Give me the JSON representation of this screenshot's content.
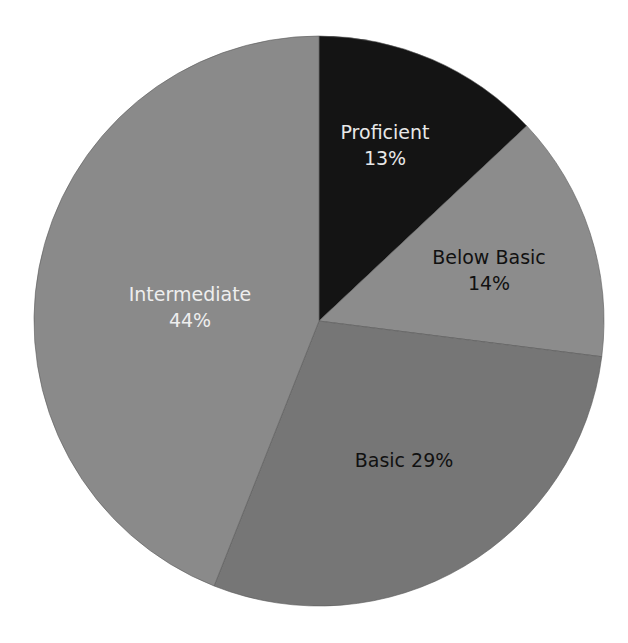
{
  "chart_data": {
    "type": "pie",
    "title": "",
    "start_angle_deg": 0,
    "direction": "clockwise",
    "categories": [
      "Proficient",
      "Below Basic",
      "Basic",
      "Intermediate"
    ],
    "values": [
      13,
      14,
      29,
      44
    ],
    "unit": "%",
    "legend": "none (labels inside slices)",
    "slices": [
      {
        "label": "Proficient",
        "value": 13,
        "value_text": "13%",
        "color": "#141414",
        "text_color": "#e8e8e8",
        "label_layout": "two-line",
        "label_pos": [
          385,
          145
        ]
      },
      {
        "label": "Below Basic",
        "value": 14,
        "value_text": "14%",
        "color": "#8c8c8c",
        "text_color": "#111111",
        "label_layout": "two-line",
        "label_pos": [
          489,
          270
        ]
      },
      {
        "label": "Basic",
        "value": 29,
        "value_text": "29%",
        "color": "#767676",
        "text_color": "#111111",
        "label_layout": "one-line",
        "label_pos": [
          404,
          460
        ]
      },
      {
        "label": "Intermediate",
        "value": 44,
        "value_text": "44%",
        "color": "#8a8a8a",
        "text_color": "#eeeeee",
        "label_layout": "two-line",
        "label_pos": [
          190,
          307
        ]
      }
    ],
    "geometry": {
      "cx": 319,
      "cy": 321,
      "r": 285
    }
  },
  "labels": {
    "proficient": {
      "name": "Proficient",
      "pct": "13%"
    },
    "below_basic": {
      "name": "Below Basic",
      "pct": "14%"
    },
    "basic": {
      "full": "Basic 29%"
    },
    "intermediate": {
      "name": "Intermediate",
      "pct": "44%"
    }
  }
}
